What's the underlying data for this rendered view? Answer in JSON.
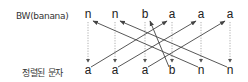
{
  "labels": {
    "top": "BW(banana)",
    "bottom": "정렬된 문자"
  },
  "top_row": [
    "n",
    "n",
    "b",
    "a",
    "a",
    "a"
  ],
  "bottom_row": [
    "a",
    "a",
    "a",
    "b",
    "n",
    "n"
  ],
  "columns_x": [
    88,
    115,
    145,
    172,
    201,
    230
  ],
  "top_y": 16,
  "bottom_y": 71,
  "lf_mapping": [
    {
      "from_bottom": 0,
      "to_top": 3
    },
    {
      "from_bottom": 1,
      "to_top": 4
    },
    {
      "from_bottom": 2,
      "to_top": 5
    },
    {
      "from_bottom": 3,
      "to_top": 2
    },
    {
      "from_bottom": 4,
      "to_top": 0
    },
    {
      "from_bottom": 5,
      "to_top": 1
    }
  ],
  "colors": {
    "text": "#222222",
    "solid_arrow": "#444444",
    "dotted_arrow": "#999999"
  }
}
